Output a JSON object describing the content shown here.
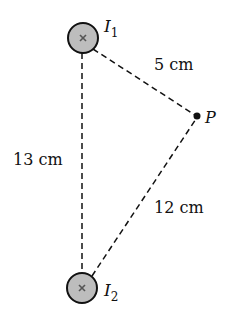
{
  "diagram": {
    "wires": [
      {
        "id": "I1",
        "label_main": "I",
        "label_sub": "1",
        "cx": 83,
        "cy": 38,
        "r": 15,
        "symbol": "x-into-page"
      },
      {
        "id": "I2",
        "label_main": "I",
        "label_sub": "2",
        "cx": 82,
        "cy": 288,
        "r": 15,
        "symbol": "x-into-page"
      }
    ],
    "point": {
      "label": "P",
      "x": 197,
      "y": 116
    },
    "distances": {
      "I1_P": "5 cm",
      "I1_I2": "13 cm",
      "I2_P": "12 cm"
    },
    "colors": {
      "wire_fill": "#bdbdbd",
      "stroke": "#111111"
    }
  }
}
